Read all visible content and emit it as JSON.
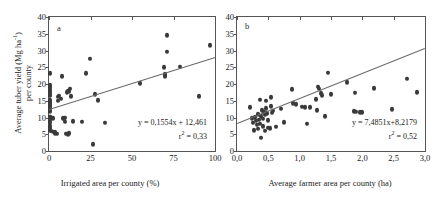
{
  "figure": {
    "y_axis_title_line1": "Average tuber yield (Mg ha",
    "y_axis_title_sup": "-1",
    "y_axis_title_line1b": ")",
    "y_axis_title_line2": "per county"
  },
  "chart_data": [
    {
      "type": "scatter",
      "panel_label": "a",
      "title": "",
      "xlabel": "Irrigated area per county (%)",
      "ylabel": "Average tuber yield (Mg ha-1) per county",
      "xlim": [
        0,
        100
      ],
      "ylim": [
        0,
        40
      ],
      "xticks": [
        0,
        25,
        50,
        75,
        100
      ],
      "xticklabels": [
        "0",
        "25",
        "50",
        "75",
        "100"
      ],
      "yticks": [
        0,
        5,
        10,
        15,
        20,
        25,
        30,
        35,
        40
      ],
      "yticklabels": [
        "0",
        "5",
        "10",
        "15",
        "20",
        "25",
        "30",
        "35",
        "40"
      ],
      "grid": false,
      "legend": false,
      "annotations": [
        "y = 0,1554x + 12,461",
        "r2 = 0,33"
      ],
      "equation": "y = 0,1554x + 12,461",
      "r_squared_label": "r",
      "r_squared_sup": "2",
      "r_squared_value": " = 0,33",
      "fit": {
        "slope": 0.1554,
        "intercept": 12.461,
        "r2": 0.33
      },
      "points": [
        [
          0.4,
          23.2
        ],
        [
          0.5,
          19.6
        ],
        [
          0.5,
          18.9
        ],
        [
          0.6,
          18.2
        ],
        [
          0.6,
          17.4
        ],
        [
          0.7,
          16.8
        ],
        [
          0.8,
          16.5
        ],
        [
          0.5,
          15.2
        ],
        [
          0.6,
          14.6
        ],
        [
          0.7,
          13.9
        ],
        [
          0.8,
          13.3
        ],
        [
          0.5,
          12.6
        ],
        [
          0.6,
          11.9
        ],
        [
          0.4,
          10.2
        ],
        [
          0.9,
          10.1
        ],
        [
          1.2,
          10.0
        ],
        [
          1.6,
          9.9
        ],
        [
          2.2,
          9.8
        ],
        [
          0.5,
          9.0
        ],
        [
          0.6,
          8.4
        ],
        [
          0.5,
          7.6
        ],
        [
          0.6,
          6.9
        ],
        [
          0.7,
          6.2
        ],
        [
          1.0,
          6.0
        ],
        [
          2.6,
          5.8
        ],
        [
          3.4,
          5.4
        ],
        [
          3.8,
          5.6
        ],
        [
          4.6,
          5.2
        ],
        [
          5.4,
          15.0
        ],
        [
          5.6,
          16.2
        ],
        [
          6.2,
          16.5
        ],
        [
          7.2,
          15.6
        ],
        [
          8.0,
          22.3
        ],
        [
          8.4,
          9.8
        ],
        [
          9.0,
          9.6
        ],
        [
          9.6,
          8.8
        ],
        [
          9.8,
          9.9
        ],
        [
          10.4,
          5.2
        ],
        [
          11.2,
          5.1
        ],
        [
          11.8,
          5.4
        ],
        [
          11.0,
          17.5
        ],
        [
          11.6,
          18.0
        ],
        [
          12.0,
          17.8
        ],
        [
          12.4,
          18.6
        ],
        [
          13.0,
          16.3
        ],
        [
          14.6,
          8.9
        ],
        [
          19.8,
          8.8
        ],
        [
          22.2,
          23.3
        ],
        [
          24.4,
          27.5
        ],
        [
          26.4,
          2.1
        ],
        [
          27.6,
          16.9
        ],
        [
          29.8,
          15.1
        ],
        [
          33.8,
          8.4
        ],
        [
          54.6,
          20.3
        ],
        [
          69.4,
          25.0
        ],
        [
          69.8,
          22.9
        ],
        [
          69.6,
          22.4
        ],
        [
          71.0,
          34.6
        ],
        [
          71.2,
          29.7
        ],
        [
          79.0,
          25.2
        ],
        [
          90.2,
          16.4
        ],
        [
          96.8,
          31.6
        ]
      ]
    },
    {
      "type": "scatter",
      "panel_label": "b",
      "title": "",
      "xlabel": "Average farmer area per county (ha)",
      "ylabel": "Average tuber yield (Mg ha-1) per county",
      "xlim": [
        0,
        3.0
      ],
      "ylim": [
        0,
        40
      ],
      "xticks": [
        0,
        0.5,
        1.0,
        1.5,
        2.0,
        2.5,
        3.0
      ],
      "xticklabels": [
        "0,0",
        "0,5",
        "1,0",
        "1,5",
        "2,0",
        "2,5",
        "3,0"
      ],
      "yticks": [
        0,
        5,
        10,
        15,
        20,
        25,
        30,
        35,
        40
      ],
      "yticklabels": [
        "0",
        "5",
        "10",
        "15",
        "20",
        "25",
        "30",
        "35",
        "40"
      ],
      "grid": false,
      "legend": false,
      "annotations": [
        "y = 7,4851x+8,2179",
        "r2 = 0,52"
      ],
      "equation": "y = 7,4851x+8,2179",
      "r_squared_label": "r",
      "r_squared_sup": "2",
      "r_squared_value": " = 0,52",
      "fit": {
        "slope": 7.4851,
        "intercept": 8.2179,
        "r2": 0.52
      },
      "points": [
        [
          0.2,
          13.0
        ],
        [
          0.24,
          9.8
        ],
        [
          0.26,
          8.4
        ],
        [
          0.27,
          6.2
        ],
        [
          0.28,
          10.1
        ],
        [
          0.3,
          9.0
        ],
        [
          0.32,
          7.8
        ],
        [
          0.33,
          11.0
        ],
        [
          0.34,
          6.6
        ],
        [
          0.35,
          9.4
        ],
        [
          0.36,
          8.2
        ],
        [
          0.37,
          15.3
        ],
        [
          0.38,
          10.4
        ],
        [
          0.38,
          4.0
        ],
        [
          0.4,
          12.2
        ],
        [
          0.41,
          9.6
        ],
        [
          0.42,
          7.4
        ],
        [
          0.43,
          11.6
        ],
        [
          0.44,
          10.8
        ],
        [
          0.45,
          6.0
        ],
        [
          0.46,
          15.0
        ],
        [
          0.47,
          12.8
        ],
        [
          0.48,
          11.2
        ],
        [
          0.49,
          7.0
        ],
        [
          0.5,
          9.2
        ],
        [
          0.52,
          6.8
        ],
        [
          0.54,
          13.4
        ],
        [
          0.55,
          16.0
        ],
        [
          0.56,
          11.4
        ],
        [
          0.58,
          12.0
        ],
        [
          0.62,
          7.2
        ],
        [
          0.7,
          12.6
        ],
        [
          0.75,
          8.6
        ],
        [
          0.88,
          18.4
        ],
        [
          0.9,
          14.3
        ],
        [
          0.94,
          14.0
        ],
        [
          1.04,
          13.2
        ],
        [
          1.08,
          13.0
        ],
        [
          1.12,
          8.2
        ],
        [
          1.16,
          13.1
        ],
        [
          1.26,
          15.4
        ],
        [
          1.28,
          12.2
        ],
        [
          1.3,
          19.2
        ],
        [
          1.31,
          18.6
        ],
        [
          1.34,
          17.2
        ],
        [
          1.36,
          16.6
        ],
        [
          1.4,
          10.4
        ],
        [
          1.45,
          23.4
        ],
        [
          1.5,
          17.0
        ],
        [
          1.76,
          20.6
        ],
        [
          1.86,
          11.8
        ],
        [
          1.9,
          11.7
        ],
        [
          1.96,
          11.6
        ],
        [
          1.99,
          11.6
        ],
        [
          1.88,
          17.4
        ],
        [
          2.18,
          18.8
        ],
        [
          2.48,
          12.4
        ],
        [
          2.72,
          21.6
        ],
        [
          2.88,
          17.6
        ]
      ]
    }
  ]
}
